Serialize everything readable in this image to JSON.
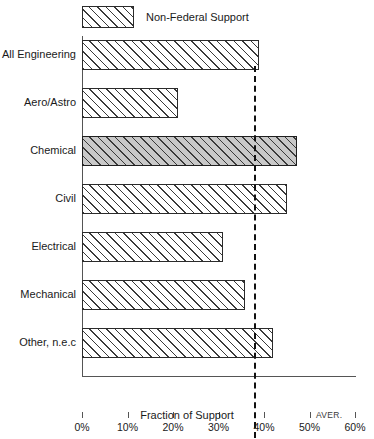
{
  "chart_data": {
    "type": "bar",
    "orientation": "horizontal",
    "title": "",
    "xlabel": "Fraction of Support",
    "ylabel": "",
    "xlim": [
      0,
      60
    ],
    "grid": false,
    "legend": {
      "position": "top-left",
      "entries": [
        {
          "label": "Non-Federal Support",
          "swatch": "hatched-diagonal"
        }
      ]
    },
    "categories": [
      "All Engineering",
      "Aero/Astro",
      "Chemical",
      "Civil",
      "Electrical",
      "Mechanical",
      "Other, n.e.c"
    ],
    "values": [
      38.8,
      21.0,
      47.2,
      45.0,
      31.0,
      35.8,
      42.0
    ],
    "highlighted_category": "Chemical",
    "annotations": [
      {
        "name": "average-line",
        "type": "vertical-dashed-line",
        "value": 37.8,
        "label": "AVER."
      }
    ],
    "xticks": [
      0,
      10,
      20,
      30,
      40,
      50,
      60
    ],
    "xtick_labels": [
      "0%",
      "10%",
      "20%",
      "30%",
      "40%",
      "50%",
      "60%"
    ]
  },
  "colors": {
    "bar_fill": "#ffffff",
    "bar_highlight_fill": "#c9c9c9",
    "bar_edge": "#2b2b2b",
    "axis": "#555555",
    "text": "#1a1a1a",
    "average_line": "#111111"
  }
}
